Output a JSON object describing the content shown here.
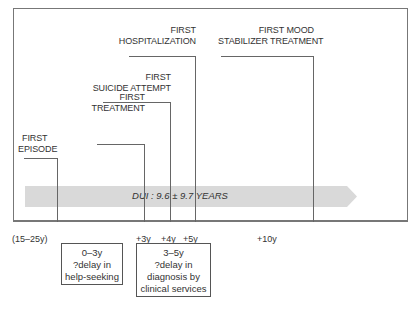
{
  "diagram": {
    "events": [
      {
        "id": "first-episode",
        "line1": "FIRST",
        "line2": "EPISODE"
      },
      {
        "id": "first-treatment",
        "line1": "FIRST",
        "line2": "TREATMENT"
      },
      {
        "id": "first-suicide-attempt",
        "line1": "FIRST",
        "line2": "SUICIDE ATTEMPT"
      },
      {
        "id": "first-hospitalization",
        "line1": "FIRST",
        "line2": "HOSPITALIZATION"
      },
      {
        "id": "first-mood-stabilizer",
        "line1": "FIRST MOOD",
        "line2": "STABILIZER TREATMENT"
      }
    ],
    "band": {
      "label": "DUI : 9.6 ± 9.7 YEARS",
      "color": "#d9d9d9"
    },
    "ticks": [
      {
        "label": "(15–25y)"
      },
      {
        "label": "+3y"
      },
      {
        "label": "+4y"
      },
      {
        "label": "+5y"
      },
      {
        "label": "+10y"
      }
    ],
    "boxes": [
      {
        "lines": [
          "0–3y",
          "?delay in",
          "help-seeking"
        ]
      },
      {
        "lines": [
          "3–5y",
          "?delay in",
          "diagnosis by",
          "clinical services"
        ]
      }
    ]
  }
}
